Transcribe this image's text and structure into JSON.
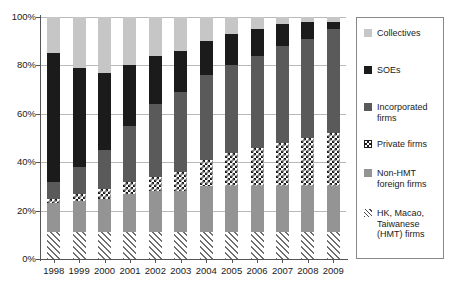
{
  "chart_data": {
    "type": "bar",
    "subtype": "stacked-percentage",
    "title": "",
    "xlabel": "",
    "ylabel": "",
    "ylim": [
      0,
      100
    ],
    "ytick_labels": [
      "0%",
      "20%",
      "40%",
      "60%",
      "80%",
      "100%"
    ],
    "ytick_values": [
      0,
      20,
      40,
      60,
      80,
      100
    ],
    "grid": true,
    "legend_position": "right",
    "stack_order_bottom_to_top": [
      "HK, Macao, Taiwanese (HMT) firms",
      "Non-HMT foreign firms",
      "Private firms",
      "Incorporated firms",
      "SOEs",
      "Collectives"
    ],
    "categories": [
      "1998",
      "1999",
      "2000",
      "2001",
      "2002",
      "2003",
      "2004",
      "2005",
      "2006",
      "2007",
      "2008",
      "2009"
    ],
    "series": [
      {
        "name": "HK, Macao, Taiwanese (HMT) firms",
        "key": "hmt",
        "color": "#6f6f6f",
        "pattern": "diagonal-hatch",
        "values": [
          11,
          11,
          11,
          11,
          11,
          11,
          11,
          11,
          11,
          11,
          11,
          11
        ]
      },
      {
        "name": "Non-HMT foreign firms",
        "key": "nonhmt",
        "color": "#949494",
        "pattern": "solid",
        "values": [
          12,
          13,
          14,
          16,
          17,
          17,
          19,
          19,
          19,
          19,
          19,
          19
        ]
      },
      {
        "name": "Private firms",
        "key": "private",
        "color": "#1b1b1b",
        "pattern": "checkerboard",
        "values": [
          2,
          3,
          4,
          5,
          6,
          8,
          11,
          14,
          16,
          18,
          20,
          22
        ]
      },
      {
        "name": "Incorporated firms",
        "key": "incorporated",
        "color": "#5a5a5a",
        "pattern": "solid",
        "values": [
          7,
          11,
          16,
          23,
          30,
          33,
          35,
          36,
          38,
          40,
          41,
          43
        ]
      },
      {
        "name": "SOEs",
        "key": "soes",
        "color": "#1b1b1b",
        "pattern": "solid",
        "values": [
          53,
          41,
          32,
          25,
          20,
          17,
          14,
          13,
          11,
          9,
          7,
          3
        ]
      },
      {
        "name": "Collectives",
        "key": "collectives",
        "color": "#c6c6c6",
        "pattern": "solid",
        "values": [
          15,
          21,
          23,
          20,
          16,
          14,
          10,
          7,
          5,
          3,
          2,
          2
        ]
      }
    ]
  },
  "legend": {
    "items": [
      {
        "label": "Collectives",
        "key": "collectives"
      },
      {
        "label": "SOEs",
        "key": "soes"
      },
      {
        "label": "Incorporated firms",
        "key": "incorporated"
      },
      {
        "label": "Private firms",
        "key": "private"
      },
      {
        "label": "Non-HMT foreign firms",
        "key": "nonhmt"
      },
      {
        "label": "HK, Macao, Taiwanese (HMT) firms",
        "key": "hmt"
      }
    ]
  },
  "colors": {
    "collectives": "#c6c6c6",
    "soes": "#1b1b1b",
    "incorporated": "#5a5a5a",
    "private": "#1b1b1b",
    "nonhmt": "#949494",
    "hmt": "#6f6f6f",
    "gridline": "#b9b9b9",
    "axis": "#555555",
    "background": "#ffffff"
  }
}
